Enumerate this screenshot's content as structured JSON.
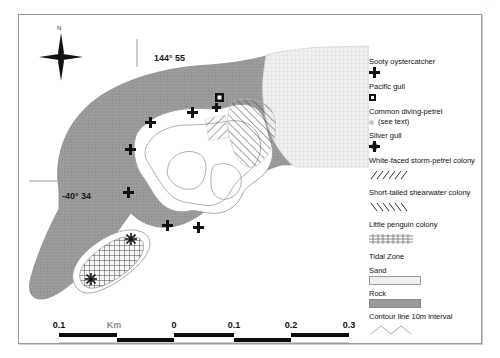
{
  "figure": {
    "scan_artifact": "·  ·   ·"
  },
  "map": {
    "north_arrow_label": "N",
    "graticule": {
      "longitude_label": "144° 55",
      "latitude_label": "-40° 34"
    },
    "features": {
      "main_island": "main-island",
      "south_island": "south-island",
      "tidal_zone": "tidal-zone",
      "sand_flat": "sand-flat"
    },
    "markers": {
      "sooty_oystercatcher_count": 7,
      "pacific_gull_count": 1,
      "silver_gull_count": 2
    }
  },
  "legend": {
    "items": [
      {
        "label": "Sooty oystercatcher",
        "symbol": "cross-icon"
      },
      {
        "label": "Pacific gull",
        "symbol": "filled-square-icon"
      },
      {
        "label": "Common diving-petrel",
        "symbol": "dot-icon",
        "note": "(see text)"
      },
      {
        "label": "Silver gull",
        "symbol": "star-icon"
      },
      {
        "label": "White-faced storm-petrel colony",
        "symbol": "forward-hatch-icon"
      },
      {
        "label": "Short-tailed shearwater colony",
        "symbol": "back-hatch-icon"
      },
      {
        "label": "Little penguin colony",
        "symbol": "cross-hatch-icon"
      },
      {
        "label": "Tidal Zone",
        "symbol": "stipple-swatch-icon"
      },
      {
        "label": "Sand",
        "symbol": "sand-swatch-icon"
      },
      {
        "label": "Rock",
        "symbol": "rock-swatch-icon"
      },
      {
        "label": "Contour line 10m interval",
        "symbol": "contour-line-icon"
      }
    ]
  },
  "scalebar": {
    "unit_label": "Km",
    "ticks": [
      "0.1",
      "Km",
      "0",
      "0.1",
      "0.2",
      "0.3"
    ],
    "tick_positions": [
      0,
      55,
      115,
      175,
      232,
      290
    ],
    "segments": [
      {
        "x": 0,
        "w": 58,
        "side": "up"
      },
      {
        "x": 58,
        "w": 57,
        "side": "dn"
      },
      {
        "x": 115,
        "w": 60,
        "side": "up"
      },
      {
        "x": 175,
        "w": 57,
        "side": "dn"
      },
      {
        "x": 232,
        "w": 58,
        "side": "up"
      }
    ]
  },
  "colors": {
    "rock": "#9a9a9a",
    "sand": "#f0f0f0",
    "tidal": "#bdbdbd",
    "ink": "#111111",
    "contour": "#8d8d8d",
    "frame": "#9a9a9a"
  }
}
